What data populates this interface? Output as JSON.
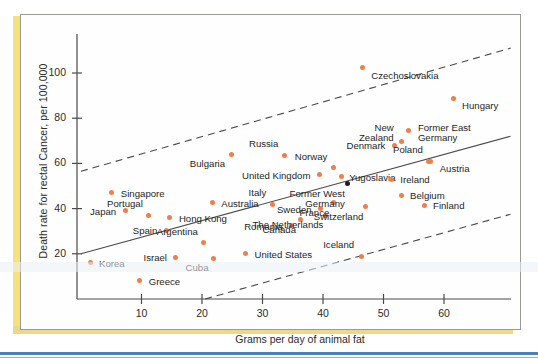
{
  "figure": {
    "accent_yellow": "#f5e27a",
    "accent_blue": "#4b7fc4",
    "point_color": "#ef7f4a",
    "highlight_point_color": "#1c1c1c",
    "frame_color": "#9a9a96"
  },
  "chart_data": {
    "type": "scatter",
    "title": "",
    "xlabel": "Grams per day of animal fat",
    "ylabel": "Death rate for rectal Cancer, per 100,000",
    "xlim": [
      0,
      71
    ],
    "ylim": [
      0,
      118
    ],
    "xticks": [
      10,
      20,
      30,
      40,
      50,
      60
    ],
    "yticks": [
      20,
      40,
      60,
      80,
      100
    ],
    "grid": false,
    "legend": "none",
    "points": [
      {
        "label": "Korea",
        "x": 1.5,
        "y": 16,
        "lx": 9,
        "ly": -4,
        "align": "left"
      },
      {
        "label": "Japan",
        "x": 7.3,
        "y": 39,
        "lx": -9,
        "ly": -4,
        "align": "right"
      },
      {
        "label": "Singapore",
        "x": 5.1,
        "y": 47,
        "lx": 9,
        "ly": -4,
        "align": "left"
      },
      {
        "label": "Greece",
        "x": 9.7,
        "y": 8,
        "lx": 9,
        "ly": -4,
        "align": "left"
      },
      {
        "label": "Portugal",
        "x": 11.2,
        "y": 37,
        "lx": -6,
        "ly": -16,
        "align": "right"
      },
      {
        "label": "Spain",
        "x": 14.1,
        "y": 30.5,
        "lx": -9,
        "ly": -4,
        "align": "right"
      },
      {
        "label": "Hong Kong",
        "x": 14.7,
        "y": 36,
        "lx": 9,
        "ly": -4,
        "align": "left"
      },
      {
        "label": "Israel",
        "x": 15.7,
        "y": 18.5,
        "lx": -9,
        "ly": -4,
        "align": "right"
      },
      {
        "label": "Argentina",
        "x": 20.3,
        "y": 25,
        "lx": -6,
        "ly": -16,
        "align": "right"
      },
      {
        "label": "Cuba",
        "x": 21.9,
        "y": 18,
        "lx": -5,
        "ly": 5,
        "align": "right"
      },
      {
        "label": "Australia",
        "x": 21.7,
        "y": 42.5,
        "lx": 9,
        "ly": -4,
        "align": "left"
      },
      {
        "label": "Bulgaria",
        "x": 24.8,
        "y": 64,
        "lx": -6,
        "ly": 5,
        "align": "right"
      },
      {
        "label": "United States",
        "x": 27.2,
        "y": 20,
        "lx": 9,
        "ly": -4,
        "align": "left"
      },
      {
        "label": "Italy",
        "x": 31.6,
        "y": 42,
        "lx": -6,
        "ly": -16,
        "align": "right"
      },
      {
        "label": "Russia",
        "x": 33.6,
        "y": 63.5,
        "lx": -6,
        "ly": -16,
        "align": "right"
      },
      {
        "label": "Romania",
        "x": 34.8,
        "y": 32.5,
        "lx": -9,
        "ly": -4,
        "align": "right"
      },
      {
        "label": "Canada",
        "x": 36.2,
        "y": 35,
        "lx": -4,
        "ly": 5,
        "align": "right"
      },
      {
        "label": "United Kingdom",
        "x": 39.4,
        "y": 55,
        "lx": -9,
        "ly": -4,
        "align": "right"
      },
      {
        "label": "Sweden",
        "x": 39.6,
        "y": 40,
        "lx": -9,
        "ly": -4,
        "align": "right"
      },
      {
        "label": "The Netherlands",
        "x": 40.4,
        "y": 37,
        "lx": -2,
        "ly": 5,
        "align": "right"
      },
      {
        "label": "France",
        "x": 41.7,
        "y": 42.5,
        "lx": -4,
        "ly": 5,
        "align": "right"
      },
      {
        "label": "Norway",
        "x": 41.7,
        "y": 58,
        "lx": -6,
        "ly": -16,
        "align": "right"
      },
      {
        "label": "Yugoslavia",
        "x": 43.0,
        "y": 54,
        "lx": 8,
        "ly": -4,
        "align": "left"
      },
      {
        "label": "Former West\nGermany",
        "x": 44.1,
        "y": 51,
        "lx": -3,
        "ly": 5,
        "align": "right",
        "dark": true
      },
      {
        "label": "Iceland",
        "x": 46.3,
        "y": 19,
        "lx": -7,
        "ly": -16,
        "align": "right"
      },
      {
        "label": "Czechoslovakia",
        "x": 46.5,
        "y": 102.5,
        "lx": 9,
        "ly": 4,
        "align": "left"
      },
      {
        "label": "Switzerland",
        "x": 47.0,
        "y": 41,
        "lx": -2,
        "ly": 6,
        "align": "right"
      },
      {
        "label": "Denmark",
        "x": 51.8,
        "y": 68,
        "lx": -9,
        "ly": -4,
        "align": "right"
      },
      {
        "label": "Ireland",
        "x": 51.3,
        "y": 53,
        "lx": 9,
        "ly": -4,
        "align": "left"
      },
      {
        "label": "New\nZealand",
        "x": 53.0,
        "y": 69.5,
        "lx": -8,
        "ly": -19,
        "align": "right"
      },
      {
        "label": "Belgium",
        "x": 52.9,
        "y": 46,
        "lx": 9,
        "ly": -4,
        "align": "left"
      },
      {
        "label": "Former East\nGermany",
        "x": 54.2,
        "y": 74.5,
        "lx": 9,
        "ly": -8,
        "align": "left"
      },
      {
        "label": "Poland",
        "x": 57.5,
        "y": 61,
        "lx": -6,
        "ly": -16,
        "align": "right"
      },
      {
        "label": "Austria",
        "x": 57.8,
        "y": 61,
        "lx": 9,
        "ly": 3,
        "align": "left"
      },
      {
        "label": "Finland",
        "x": 56.7,
        "y": 41.5,
        "lx": 9,
        "ly": -4,
        "align": "left"
      },
      {
        "label": "Hungary",
        "x": 61.5,
        "y": 88.5,
        "lx": 9,
        "ly": 2,
        "align": "left"
      }
    ],
    "lines": [
      {
        "name": "regression-line",
        "style": "solid",
        "x0": 0,
        "y0": 20,
        "x1": 71,
        "y1": 72
      },
      {
        "name": "upper-confidence-band",
        "style": "dashed",
        "x0": 0,
        "y0": 56.5,
        "x1": 71,
        "y1": 111
      },
      {
        "name": "lower-confidence-band",
        "style": "dashed",
        "x0": 20.5,
        "y0": 0,
        "x1": 71,
        "y1": 37.5
      }
    ]
  }
}
